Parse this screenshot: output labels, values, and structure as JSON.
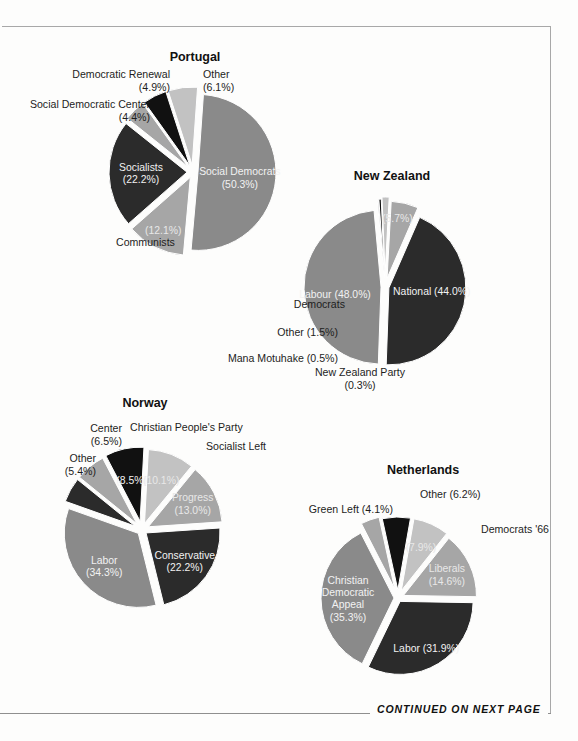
{
  "page": {
    "footer_note": "CONTINUED ON NEXT PAGE"
  },
  "palette": {
    "dark": "#2b2b2b",
    "black": "#111111",
    "mid_dark": "#5e5e5e",
    "mid": "#8a8a8a",
    "mid_light": "#a6a6a6",
    "light": "#c2c2c2",
    "lighter": "#cfcfcf",
    "outline": "#ffffff"
  },
  "charts": [
    {
      "id": "portugal",
      "title": "Portugal",
      "chart_data": {
        "type": "pie",
        "title": "Portugal",
        "categories": [
          "Social Democrats",
          "Communists",
          "Socialists",
          "Social Democratic Center",
          "Democratic Renewal",
          "Other"
        ],
        "values": [
          50.3,
          12.1,
          22.2,
          4.4,
          4.9,
          6.1
        ],
        "labels": [
          "Social Democrats (50.3%)",
          "(12.1%)",
          "Socialists (22.2%)",
          "Social Democratic Center (4.4%)",
          "Democratic Renewal (4.9%)",
          "Other (6.1%)"
        ]
      },
      "slices": [
        {
          "name": "Social Democrats",
          "pct": "50.3%",
          "value": 50.3,
          "color": "#8a8a8a",
          "inside": [
            "Social Democrats",
            "(50.3%)"
          ],
          "text_class": "st-light"
        },
        {
          "name": "Communists",
          "pct": "12.1%",
          "value": 12.1,
          "color": "#a6a6a6",
          "inside": [
            "(12.1%)"
          ],
          "text_class": "st-dark"
        },
        {
          "name": "Socialists",
          "pct": "22.2%",
          "value": 22.2,
          "color": "#2b2b2b",
          "inside": [
            "Socialists",
            "(22.2%)"
          ],
          "text_class": "st-light"
        },
        {
          "name": "Social Democratic Center",
          "pct": "4.4%",
          "value": 4.4,
          "color": "#a6a6a6",
          "inside": [],
          "text_class": "st-dark"
        },
        {
          "name": "Democratic Renewal",
          "pct": "4.9%",
          "value": 4.9,
          "color": "#111111",
          "inside": [],
          "text_class": "st-light"
        },
        {
          "name": "Other",
          "pct": "6.1%",
          "value": 6.1,
          "color": "#c2c2c2",
          "inside": [],
          "text_class": "st-dark"
        }
      ],
      "outside_labels": [
        {
          "key": "democratic-renewal",
          "lines": [
            "Democratic Renewal",
            "(4.9%)"
          ]
        },
        {
          "key": "social-democratic-center",
          "lines": [
            "Social Democratic Center",
            "(4.4%)"
          ]
        },
        {
          "key": "other",
          "lines": [
            "Other",
            "(6.1%)"
          ]
        },
        {
          "key": "communists",
          "lines": [
            "Communists"
          ]
        }
      ]
    },
    {
      "id": "new-zealand",
      "title": "New Zealand",
      "chart_data": {
        "type": "pie",
        "title": "New Zealand",
        "categories": [
          "National",
          "Labour",
          "Democrats",
          "Other",
          "Mana Motuhake",
          "New Zealand Party"
        ],
        "values": [
          44.0,
          48.0,
          5.7,
          1.5,
          0.5,
          0.3
        ],
        "labels": [
          "National (44.0%)",
          "Labour (48.0%)",
          "Democrats (5.7%)",
          "Other (1.5%)",
          "Mana Motuhake (0.5%)",
          "New Zealand Party (0.3%)"
        ]
      },
      "slices": [
        {
          "name": "National",
          "pct": "44.0%",
          "value": 44.0,
          "color": "#2b2b2b",
          "inside": [
            "National (44.0%)"
          ],
          "text_class": "st-light"
        },
        {
          "name": "Labour",
          "pct": "48.0%",
          "value": 48.0,
          "color": "#8a8a8a",
          "inside": [
            "Labour (48.0%)"
          ],
          "text_class": "st-light"
        },
        {
          "name": "Democrats",
          "pct": "5.7%",
          "value": 5.7,
          "color": "#a6a6a6",
          "inside": [
            "(5.7%)"
          ],
          "text_class": "st-dark"
        },
        {
          "name": "Other",
          "pct": "1.5%",
          "value": 1.5,
          "color": "#c2c2c2",
          "inside": [],
          "text_class": "st-dark"
        },
        {
          "name": "Mana Motuhake",
          "pct": "0.5%",
          "value": 0.5,
          "color": "#111111",
          "inside": [],
          "text_class": "st-light"
        },
        {
          "name": "New Zealand Party",
          "pct": "0.3%",
          "value": 0.3,
          "color": "#cfcfcf",
          "inside": [],
          "text_class": "st-dark"
        }
      ],
      "outside_labels": [
        {
          "key": "democrats",
          "lines": [
            "Democrats"
          ]
        },
        {
          "key": "other",
          "lines": [
            "Other (1.5%)"
          ]
        },
        {
          "key": "mana-motuhake",
          "lines": [
            "Mana Motuhake (0.5%)"
          ]
        },
        {
          "key": "new-zealand-party",
          "lines": [
            "New Zealand Party",
            "(0.3%)"
          ]
        }
      ]
    },
    {
      "id": "norway",
      "title": "Norway",
      "chart_data": {
        "type": "pie",
        "title": "Norway",
        "categories": [
          "Christian People's Party",
          "Socialist Left",
          "Progress",
          "Conservative",
          "Labor",
          "Other",
          "Center"
        ],
        "values": [
          8.5,
          10.1,
          13.0,
          22.2,
          34.3,
          5.4,
          6.5
        ],
        "labels": [
          "Christian People's Party (8.5%)",
          "Socialist Left (10.1%)",
          "Progress (13.0%)",
          "Conservative (22.2%)",
          "Labor (34.3%)",
          "Other (5.4%)",
          "Center (6.5%)"
        ]
      },
      "slices": [
        {
          "name": "Christian People's Party",
          "pct": "8.5%",
          "value": 8.5,
          "color": "#111111",
          "inside": [
            "(8.5%)"
          ],
          "text_class": "st-light"
        },
        {
          "name": "Socialist Left",
          "pct": "10.1%",
          "value": 10.1,
          "color": "#c2c2c2",
          "inside": [
            "(10.1%)"
          ],
          "text_class": "st-dark"
        },
        {
          "name": "Progress",
          "pct": "13.0%",
          "value": 13.0,
          "color": "#a6a6a6",
          "inside": [
            "Progress",
            "(13.0%)"
          ],
          "text_class": "st-dark"
        },
        {
          "name": "Conservative",
          "pct": "22.2%",
          "value": 22.2,
          "color": "#2b2b2b",
          "inside": [
            "Conservative",
            "(22.2%)"
          ],
          "text_class": "st-light"
        },
        {
          "name": "Labor",
          "pct": "34.3%",
          "value": 34.3,
          "color": "#8a8a8a",
          "inside": [
            "Labor",
            "(34.3%)"
          ],
          "text_class": "st-light"
        },
        {
          "name": "Other",
          "pct": "5.4%",
          "value": 5.4,
          "color": "#2b2b2b",
          "inside": [],
          "text_class": "st-light"
        },
        {
          "name": "Center",
          "pct": "6.5%",
          "value": 6.5,
          "color": "#a6a6a6",
          "inside": [],
          "text_class": "st-dark"
        }
      ],
      "outside_labels": [
        {
          "key": "christian-peoples-party",
          "lines": [
            "Christian People's Party"
          ]
        },
        {
          "key": "socialist-left",
          "lines": [
            "Socialist Left"
          ]
        },
        {
          "key": "center",
          "lines": [
            "Center",
            "(6.5%)"
          ]
        },
        {
          "key": "other",
          "lines": [
            "Other",
            "(5.4%)"
          ]
        }
      ]
    },
    {
      "id": "netherlands",
      "title": "Netherlands",
      "chart_data": {
        "type": "pie",
        "title": "Netherlands",
        "categories": [
          "Other",
          "Democrats '66",
          "Liberals",
          "Labor",
          "Christian Democratic Appeal",
          "Green Left"
        ],
        "values": [
          6.2,
          7.9,
          14.6,
          31.9,
          35.3,
          4.1
        ],
        "labels": [
          "Other (6.2%)",
          "Democrats '66 (7.9%)",
          "Liberals (14.6%)",
          "Labor (31.9%)",
          "Christian Democratic Appeal (35.3%)",
          "Green Left (4.1%)"
        ]
      },
      "slices": [
        {
          "name": "Other",
          "pct": "6.2%",
          "value": 6.2,
          "color": "#111111",
          "inside": [],
          "text_class": "st-light"
        },
        {
          "name": "Democrats '66",
          "pct": "7.9%",
          "value": 7.9,
          "color": "#c2c2c2",
          "inside": [
            "(7.9%)"
          ],
          "text_class": "st-dark"
        },
        {
          "name": "Liberals",
          "pct": "14.6%",
          "value": 14.6,
          "color": "#a6a6a6",
          "inside": [
            "Liberals",
            "(14.6%)"
          ],
          "text_class": "st-dark"
        },
        {
          "name": "Labor",
          "pct": "31.9%",
          "value": 31.9,
          "color": "#2b2b2b",
          "inside": [
            "Labor (31.9%)"
          ],
          "text_class": "st-light"
        },
        {
          "name": "Christian Democratic Appeal",
          "pct": "35.3%",
          "value": 35.3,
          "color": "#8a8a8a",
          "inside": [
            "Christian",
            "Democratic",
            "Appeal",
            "(35.3%)"
          ],
          "text_class": "st-light"
        },
        {
          "name": "Green Left",
          "pct": "4.1%",
          "value": 4.1,
          "color": "#a6a6a6",
          "inside": [],
          "text_class": "st-dark"
        }
      ],
      "outside_labels": [
        {
          "key": "green-left",
          "lines": [
            "Green Left (4.1%)"
          ]
        },
        {
          "key": "other",
          "lines": [
            "Other (6.2%)"
          ]
        },
        {
          "key": "democrats-66",
          "lines": [
            "Democrats '66"
          ]
        }
      ]
    }
  ]
}
